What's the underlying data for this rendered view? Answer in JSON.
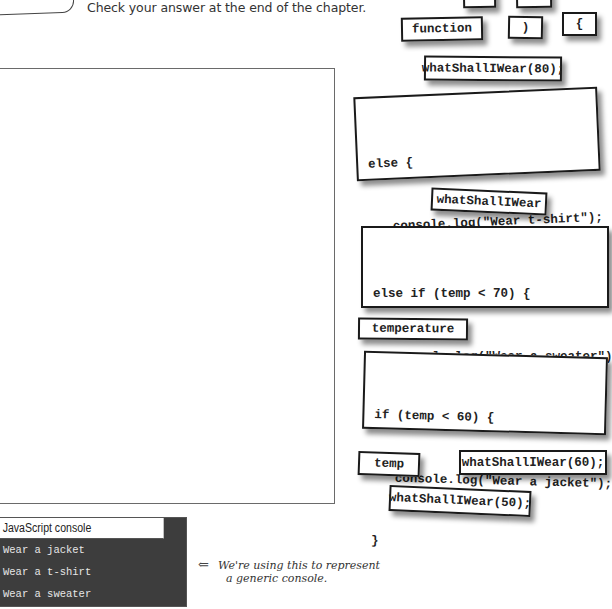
{
  "instructions": {
    "text": "Check your answer at the end of the chapter."
  },
  "answer_area": {
    "label": "empty answer frame"
  },
  "magnets": {
    "partial_top_1": {
      "label": ""
    },
    "partial_top_2": {
      "label": ""
    },
    "function_kw": {
      "label": "function"
    },
    "close_paren": {
      "label": ")"
    },
    "open_brace": {
      "label": "{"
    },
    "call_80": {
      "label": "whatShallIWear(80);"
    },
    "else_block": {
      "lines": [
        "else {",
        "console.log(\"Wear t-shirt\");",
        "}"
      ]
    },
    "fn_name": {
      "label": "whatShallIWear"
    },
    "else_if_block": {
      "lines": [
        "else if (temp < 70) {",
        "console.log(\"Wear a sweater\");",
        "}"
      ]
    },
    "temperature_param": {
      "label": "temperature"
    },
    "if_block": {
      "lines": [
        "if (temp < 60) {",
        "console.log(\"Wear a jacket\");",
        "}"
      ]
    },
    "temp_param": {
      "label": "temp"
    },
    "call_60": {
      "label": "whatShallIWear(60);"
    },
    "call_50": {
      "label": "whatShallIWear(50);"
    }
  },
  "console": {
    "title": "JavaScript console",
    "lines": [
      "Wear a jacket",
      "Wear a t-shirt",
      "Wear a sweater"
    ]
  },
  "annotation": {
    "arrow": "⇐",
    "line1": "We're using this to represent",
    "line2": "a generic console."
  }
}
